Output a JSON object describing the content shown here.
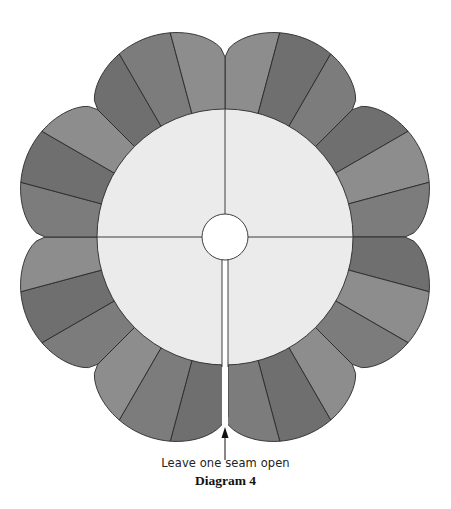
{
  "diagram": {
    "title": "Diagram 4",
    "annotation": "Leave one seam open",
    "shape": "Dresden plate quilt block",
    "wedge_count": 24,
    "lobe_count": 8,
    "center": [
      225,
      237
    ],
    "inner_circle_radius": 128,
    "center_hole_radius": 23,
    "notch_radius": 180,
    "peak_radius": 214,
    "open_seam_gap_px": 6,
    "colors": {
      "wedge_dark": "#6f6f6f",
      "wedge_mid": "#7c7c7c",
      "wedge_light": "#8d8d8d",
      "inner_circle": "#ebebeb",
      "center_hole": "#ffffff",
      "line": "#2a2a2a"
    },
    "wedge_shades": [
      "light",
      "dark",
      "mid",
      "dark",
      "light",
      "mid",
      "dark",
      "light",
      "mid",
      "light",
      "dark",
      "mid",
      "dark",
      "mid",
      "light",
      "mid",
      "dark",
      "light",
      "mid",
      "dark",
      "light",
      "dark",
      "mid",
      "light"
    ]
  }
}
